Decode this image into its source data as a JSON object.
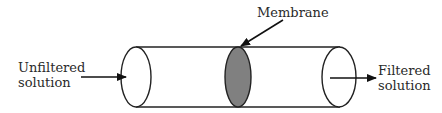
{
  "diagram": {
    "labels": {
      "inlet_line1": "Unfiltered",
      "inlet_line2": "solution",
      "membrane": "Membrane",
      "outlet_line1": "Filtered",
      "outlet_line2": "solution"
    },
    "colors": {
      "stroke": "#222222",
      "membrane_fill": "#808080",
      "background": "#ffffff"
    }
  }
}
